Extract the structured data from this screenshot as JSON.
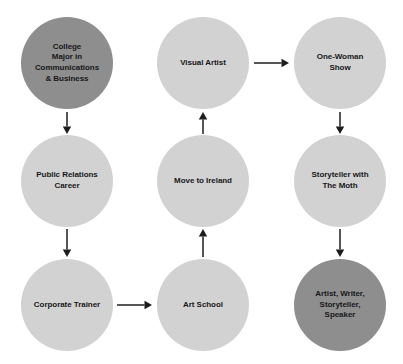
{
  "diagram": {
    "type": "flowchart",
    "title": "",
    "colors": {
      "node_light": "#d2d2d2",
      "node_dark": "#8e8e8e",
      "arrow": "#1d1d1f",
      "label_text": "#18181a",
      "background": "#ffffff"
    },
    "nodes": [
      {
        "id": "college-major",
        "label": "College\nMajor in\nCommunications\n& Business",
        "style": "dark",
        "cx": 67,
        "cy": 63,
        "r": 46,
        "row": 1,
        "col": 1
      },
      {
        "id": "visual-artist",
        "label": "Visual Artist",
        "style": "light",
        "cx": 203,
        "cy": 63,
        "r": 46,
        "row": 1,
        "col": 2
      },
      {
        "id": "one-woman-show",
        "label": "One-Woman\nShow",
        "style": "light",
        "cx": 340,
        "cy": 63,
        "r": 46,
        "row": 1,
        "col": 3
      },
      {
        "id": "public-relations-career",
        "label": "Public Relations\nCareer",
        "style": "light",
        "cx": 67,
        "cy": 181,
        "r": 46,
        "row": 2,
        "col": 1
      },
      {
        "id": "move-to-ireland",
        "label": "Move to Ireland",
        "style": "light",
        "cx": 203,
        "cy": 181,
        "r": 46,
        "row": 2,
        "col": 2
      },
      {
        "id": "storyteller-with-the-moth",
        "label": "Storyteller with\nThe Moth",
        "style": "light",
        "cx": 340,
        "cy": 181,
        "r": 46,
        "row": 2,
        "col": 3
      },
      {
        "id": "corporate-trainer",
        "label": "Corporate Trainer",
        "style": "light",
        "cx": 67,
        "cy": 305,
        "r": 46,
        "row": 3,
        "col": 1
      },
      {
        "id": "art-school",
        "label": "Art School",
        "style": "light",
        "cx": 203,
        "cy": 305,
        "r": 46,
        "row": 3,
        "col": 2
      },
      {
        "id": "artist-writer-storyteller-speaker",
        "label": "Artist, Writer,\nStoryteller,\nSpeaker",
        "style": "dark",
        "cx": 340,
        "cy": 305,
        "r": 46,
        "row": 3,
        "col": 3
      }
    ],
    "edges": [
      {
        "id": "edge-college-to-pr",
        "from": "college-major",
        "to": "public-relations-career",
        "direction": "down",
        "x1": 67,
        "y1": 112,
        "x2": 67,
        "y2": 134
      },
      {
        "id": "edge-pr-to-corporate-trainer",
        "from": "public-relations-career",
        "to": "corporate-trainer",
        "direction": "down",
        "x1": 67,
        "y1": 229,
        "x2": 67,
        "y2": 257
      },
      {
        "id": "edge-corporate-trainer-to-art-school",
        "from": "corporate-trainer",
        "to": "art-school",
        "direction": "right",
        "x1": 117,
        "y1": 305,
        "x2": 152,
        "y2": 305
      },
      {
        "id": "edge-art-school-to-move-to-ireland",
        "from": "art-school",
        "to": "move-to-ireland",
        "direction": "up",
        "x1": 203,
        "y1": 257,
        "x2": 203,
        "y2": 229
      },
      {
        "id": "edge-move-to-ireland-to-visual-artist",
        "from": "move-to-ireland",
        "to": "visual-artist",
        "direction": "up",
        "x1": 203,
        "y1": 134,
        "x2": 203,
        "y2": 112
      },
      {
        "id": "edge-visual-artist-to-one-woman-show",
        "from": "visual-artist",
        "to": "one-woman-show",
        "direction": "right",
        "x1": 254,
        "y1": 63,
        "x2": 289,
        "y2": 63
      },
      {
        "id": "edge-one-woman-show-to-storyteller",
        "from": "one-woman-show",
        "to": "storyteller-with-the-moth",
        "direction": "down",
        "x1": 340,
        "y1": 112,
        "x2": 340,
        "y2": 134
      },
      {
        "id": "edge-storyteller-to-artist-writer",
        "from": "storyteller-with-the-moth",
        "to": "artist-writer-storyteller-speaker",
        "direction": "down",
        "x1": 340,
        "y1": 229,
        "x2": 340,
        "y2": 257
      }
    ]
  }
}
